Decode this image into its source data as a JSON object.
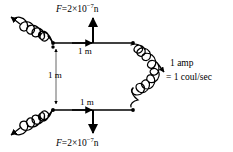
{
  "figure": {
    "background_color": "#ffffff",
    "line_color": "#000000",
    "width": 233,
    "height": 152
  },
  "labels": {
    "force_top": {
      "symbol": "F",
      "equals": "=",
      "coefficient": "2",
      "times": "×",
      "base": "10",
      "exponent": "−7",
      "unit": "n",
      "full_text": "F = 2×10⁻⁷ n"
    },
    "force_bottom": {
      "symbol": "F",
      "equals": "=",
      "coefficient": "2",
      "times": "×",
      "base": "10",
      "exponent": "−7",
      "unit": "n",
      "full_text": "F = 2×10⁻⁷ n"
    },
    "distance_top": "1 m",
    "distance_left": "1 m",
    "distance_bottom": "1 m",
    "current_line1": "1  amp",
    "current_line2": "= 1  coul/sec"
  },
  "elements": {
    "top_wire": "horizontal conductor segment with rightward current arrow",
    "bottom_wire": "horizontal conductor segment with rightward current arrow",
    "separation_line": "vertical double-headed dimension line, 1 m",
    "force_arrow_top": "upward force vector",
    "force_arrow_bottom": "downward force vector",
    "coil_top_left": "helical coil lead exiting upper left with arrowhead",
    "coil_bottom_left": "helical coil lead exiting lower left with arrowhead",
    "coil_right": "C-shaped helical coil joining the two wires on the right",
    "junction_dots": 4
  }
}
